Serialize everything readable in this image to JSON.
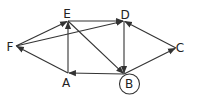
{
  "diagram": {
    "type": "directed-graph",
    "nodes": [
      {
        "id": "A",
        "label": "A",
        "x": 68,
        "y": 73,
        "lx": 66,
        "ly": 87,
        "circled": false
      },
      {
        "id": "B",
        "label": "B",
        "x": 124,
        "y": 74,
        "lx": 129,
        "ly": 88,
        "circled": true
      },
      {
        "id": "C",
        "label": "C",
        "x": 176,
        "y": 48,
        "lx": 180,
        "ly": 52,
        "circled": false
      },
      {
        "id": "D",
        "label": "D",
        "x": 124,
        "y": 21,
        "lx": 125,
        "ly": 19,
        "circled": false
      },
      {
        "id": "E",
        "label": "E",
        "x": 68,
        "y": 21,
        "lx": 67,
        "ly": 18,
        "circled": false
      },
      {
        "id": "F",
        "label": "F",
        "x": 16,
        "y": 46,
        "lx": 10,
        "ly": 51,
        "circled": false
      }
    ],
    "edges": [
      {
        "from": "A",
        "to": "F"
      },
      {
        "from": "F",
        "to": "E"
      },
      {
        "from": "F",
        "to": "D"
      },
      {
        "from": "A",
        "to": "E"
      },
      {
        "from": "E",
        "to": "D"
      },
      {
        "from": "E",
        "to": "B"
      },
      {
        "from": "D",
        "to": "B"
      },
      {
        "from": "B",
        "to": "A"
      },
      {
        "from": "B",
        "to": "C"
      },
      {
        "from": "C",
        "to": "D"
      }
    ],
    "highlight_node": "B",
    "colors": {
      "stroke": "#333333",
      "text": "#222222",
      "background": "#ffffff"
    }
  }
}
